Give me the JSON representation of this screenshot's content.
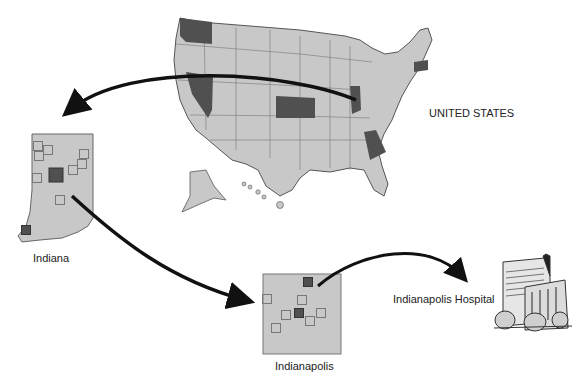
{
  "labels": {
    "country": "UNITED STATES",
    "state": "Indiana",
    "city": "Indianapolis",
    "hospital": "Indianapolis Hospital"
  },
  "colors": {
    "region_fill": "#c8c8c8",
    "highlight_fill": "#505050",
    "border": "#555555",
    "arrow": "#111111",
    "background": "#ffffff"
  },
  "us_map": {
    "highlighted_states": [
      "Washington",
      "Nevada",
      "Kansas",
      "Indiana",
      "Georgia",
      "Massachusetts"
    ]
  },
  "indiana_map": {
    "markers": [
      {
        "x": 38,
        "y": 146,
        "selected": false
      },
      {
        "x": 48,
        "y": 150,
        "selected": false
      },
      {
        "x": 39,
        "y": 156,
        "selected": false
      },
      {
        "x": 84,
        "y": 154,
        "selected": false
      },
      {
        "x": 82,
        "y": 164,
        "selected": false
      },
      {
        "x": 73,
        "y": 170,
        "selected": false
      },
      {
        "x": 37,
        "y": 178,
        "selected": false
      },
      {
        "x": 56,
        "y": 175,
        "selected": true
      },
      {
        "x": 60,
        "y": 200,
        "selected": false
      },
      {
        "x": 26,
        "y": 230,
        "selected": true
      }
    ]
  },
  "indianapolis_map": {
    "markers": [
      {
        "x": 308,
        "y": 282,
        "selected": true
      },
      {
        "x": 267,
        "y": 299,
        "selected": false
      },
      {
        "x": 302,
        "y": 300,
        "selected": false
      },
      {
        "x": 286,
        "y": 315,
        "selected": false
      },
      {
        "x": 299,
        "y": 313,
        "selected": true
      },
      {
        "x": 321,
        "y": 313,
        "selected": false
      },
      {
        "x": 310,
        "y": 321,
        "selected": false
      },
      {
        "x": 276,
        "y": 328,
        "selected": false
      }
    ]
  }
}
